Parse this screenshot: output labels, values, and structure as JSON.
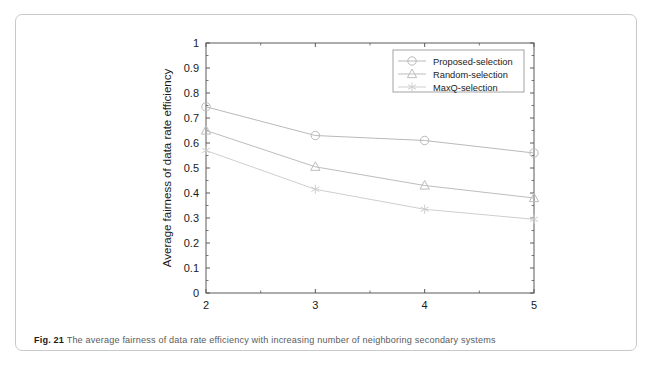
{
  "figure": {
    "caption_label": "Fig. 21",
    "caption_text": "The average fairness of data rate efficiency with increasing number of neighboring secondary systems"
  },
  "colors": {
    "axis": "#5a5a5a",
    "text": "#1a1a1a",
    "series_1": "#b9b9b9",
    "series_2": "#bdbdbd",
    "series_3": "#cfcfcf",
    "legend_border": "#9a9a9a",
    "card_border": "#c9c9c9",
    "caption_text": "#5a5c5e"
  },
  "chart_data": {
    "type": "line",
    "title": "",
    "xlabel": "The number of systems",
    "ylabel": "Average fairness of data rate efficiency",
    "x": [
      2,
      3,
      4,
      5
    ],
    "xlim": [
      2,
      5
    ],
    "ylim": [
      0,
      1
    ],
    "xticks": [
      2,
      3,
      4,
      5
    ],
    "xticklabels": [
      "2",
      "3",
      "4",
      "5"
    ],
    "xminorticks": [
      2.5,
      3.5,
      4.5
    ],
    "yticks": [
      0,
      0.1,
      0.2,
      0.3,
      0.4,
      0.5,
      0.6,
      0.7,
      0.8,
      0.9,
      1
    ],
    "yticklabels": [
      "0",
      "0.1",
      "0.2",
      "0.3",
      "0.4",
      "0.5",
      "0.6",
      "0.7",
      "0.8",
      "0.9",
      "1"
    ],
    "grid": false,
    "legend_position": "upper right",
    "series": [
      {
        "name": "Proposed-selection",
        "marker": "circle",
        "values": [
          0.745,
          0.63,
          0.61,
          0.56
        ]
      },
      {
        "name": "Random-selection",
        "marker": "triangle",
        "values": [
          0.65,
          0.505,
          0.43,
          0.38
        ]
      },
      {
        "name": "MaxQ-selection",
        "marker": "star",
        "values": [
          0.57,
          0.415,
          0.335,
          0.295
        ]
      }
    ]
  }
}
